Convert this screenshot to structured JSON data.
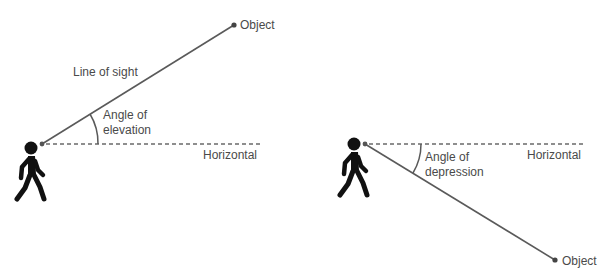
{
  "colors": {
    "line": "#5a5a5a",
    "dash": "#6a6a6a",
    "text": "#4a4a4a",
    "figure": "#111111"
  },
  "elevation": {
    "object_label": "Object",
    "line_of_sight_label": "Line of sight",
    "angle_label_line1": "Angle of",
    "angle_label_line2": "elevation",
    "horizontal_label": "Horizontal",
    "figure_icon": "walking-person-icon"
  },
  "depression": {
    "object_label": "Object",
    "angle_label_line1": "Angle of",
    "angle_label_line2": "depression",
    "horizontal_label": "Horizontal",
    "figure_icon": "walking-person-icon"
  }
}
